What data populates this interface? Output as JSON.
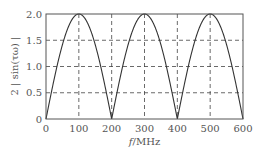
{
  "chart_data": {
    "type": "line",
    "title": "",
    "xlabel": "f/MHz",
    "ylabel": "2 | sin(τω) |",
    "xlim": [
      0,
      600
    ],
    "ylim": [
      0,
      2.0
    ],
    "x_ticks": [
      "0",
      "100",
      "200",
      "300",
      "400",
      "500",
      "600"
    ],
    "y_ticks": [
      "0",
      "0.5",
      "1.0",
      "1.5",
      "2.0"
    ],
    "grid": {
      "on": true,
      "style": "dashed"
    },
    "legend": null,
    "series": [
      {
        "name": "2|sin(τω)|",
        "x": [
          0,
          50,
          100,
          150,
          200,
          250,
          300,
          350,
          400,
          450,
          500,
          550,
          600
        ],
        "values": [
          0,
          1.414,
          2.0,
          1.414,
          0,
          1.414,
          2.0,
          1.414,
          0,
          1.414,
          2.0,
          1.414,
          0
        ]
      }
    ]
  },
  "axes": {
    "xlabel_italic": "f",
    "xlabel_unit": "/MHz",
    "ylabel": "2 | sin(τω) |"
  }
}
